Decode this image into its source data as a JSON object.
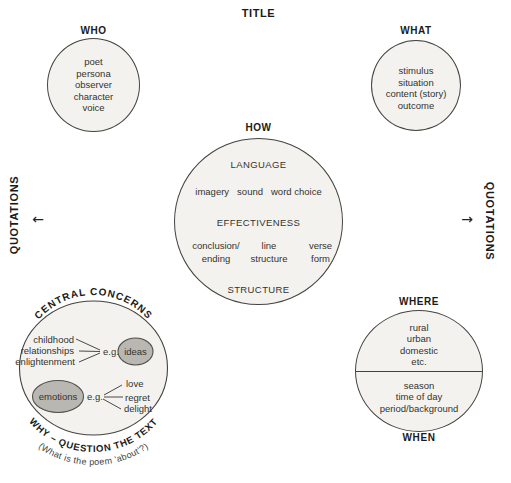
{
  "title": "TITLE",
  "who": {
    "label": "WHO",
    "items": [
      "poet",
      "persona",
      "observer",
      "character",
      "voice"
    ]
  },
  "what": {
    "label": "WHAT",
    "items": [
      "stimulus",
      "situation",
      "content (story)",
      "outcome"
    ]
  },
  "how": {
    "label": "HOW",
    "language_heading": "LANGUAGE",
    "language_items": [
      "imagery",
      "sound",
      "word choice"
    ],
    "effectiveness_heading": "EFFECTIVENESS",
    "technique_columns": [
      {
        "line1": "conclusion/",
        "line2": "ending"
      },
      {
        "line1": "line",
        "line2": "structure"
      },
      {
        "line1": "verse",
        "line2": "form"
      }
    ],
    "structure_heading": "STRUCTURE"
  },
  "quotations_left": {
    "label": "QUOTATIONS",
    "arrow": "←"
  },
  "quotations_right": {
    "label": "QUOTATIONS",
    "arrow": "→"
  },
  "central_concerns": {
    "arc_label": "CENTRAL CONCERNS",
    "ideas_sources": [
      "childhood",
      "relationships",
      "enlightenment"
    ],
    "eg_top": "e.g.",
    "ideas_label": "ideas",
    "emotions_label": "emotions",
    "eg_bottom": "e.g.",
    "emotion_examples": [
      "love",
      "regret",
      "delight"
    ],
    "why_arc_label": "WHY – QUESTION THE TEXT",
    "why_sub_label": "(What is the poem 'about'?)"
  },
  "where_when": {
    "where_label": "WHERE",
    "where_items": [
      "rural",
      "urban",
      "domestic",
      "etc."
    ],
    "when_items": [
      "season",
      "time of day",
      "period/background"
    ],
    "when_label": "WHEN"
  },
  "colors": {
    "circle_fill": "#f3f2ee",
    "circle_outline": "#44433f",
    "highlight_ellipse_fill": "#b8b7b1",
    "text": "#343330",
    "label_text": "#1b1b19"
  }
}
